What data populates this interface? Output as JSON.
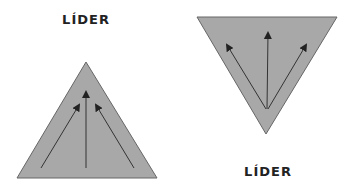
{
  "diagrams": [
    {
      "label": "LÍDER",
      "orientation": "upward"
    },
    {
      "label": "LÍDER",
      "orientation": "downward"
    }
  ],
  "colors": {
    "fill": "#a8a8a8",
    "stroke": "#555555",
    "arrow": "#222222",
    "text": "#222222"
  }
}
